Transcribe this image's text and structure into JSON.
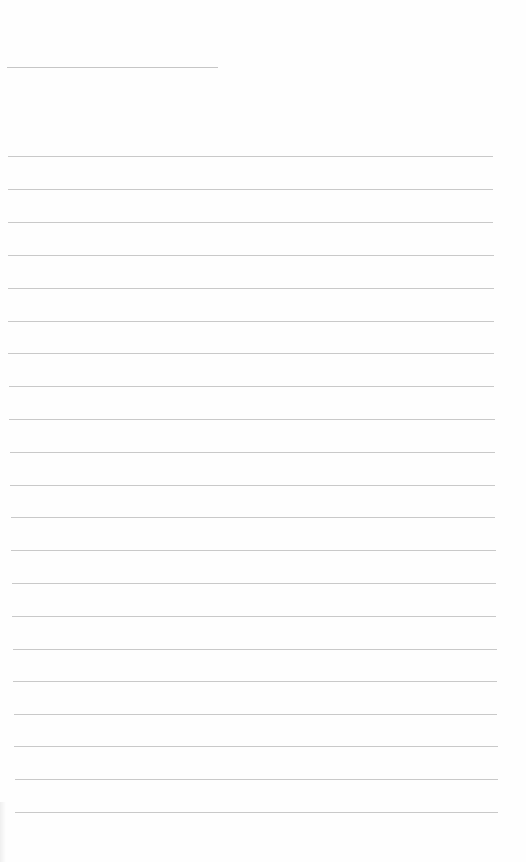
{
  "page": {
    "type": "lined-paper",
    "background_color": "#fefefe",
    "line_color": "#c9c9c9",
    "header_line": {
      "y": 67,
      "x_start": 7,
      "x_end": 218
    },
    "ruled_lines": [
      {
        "y": 156,
        "x_start": 8,
        "x_end": 493
      },
      {
        "y": 189,
        "x_start": 8,
        "x_end": 493
      },
      {
        "y": 222,
        "x_start": 8,
        "x_end": 493
      },
      {
        "y": 255,
        "x_start": 8,
        "x_end": 494
      },
      {
        "y": 288,
        "x_start": 8,
        "x_end": 494
      },
      {
        "y": 321,
        "x_start": 8,
        "x_end": 494
      },
      {
        "y": 353,
        "x_start": 8,
        "x_end": 494
      },
      {
        "y": 386,
        "x_start": 9,
        "x_end": 494
      },
      {
        "y": 419,
        "x_start": 9,
        "x_end": 495
      },
      {
        "y": 452,
        "x_start": 10,
        "x_end": 495
      },
      {
        "y": 485,
        "x_start": 10,
        "x_end": 495
      },
      {
        "y": 517,
        "x_start": 11,
        "x_end": 495
      },
      {
        "y": 550,
        "x_start": 11,
        "x_end": 496
      },
      {
        "y": 583,
        "x_start": 12,
        "x_end": 496
      },
      {
        "y": 616,
        "x_start": 12,
        "x_end": 496
      },
      {
        "y": 649,
        "x_start": 13,
        "x_end": 497
      },
      {
        "y": 681,
        "x_start": 13,
        "x_end": 497
      },
      {
        "y": 714,
        "x_start": 14,
        "x_end": 497
      },
      {
        "y": 746,
        "x_start": 14,
        "x_end": 498
      },
      {
        "y": 779,
        "x_start": 15,
        "x_end": 498
      },
      {
        "y": 812,
        "x_start": 15,
        "x_end": 498
      }
    ]
  }
}
